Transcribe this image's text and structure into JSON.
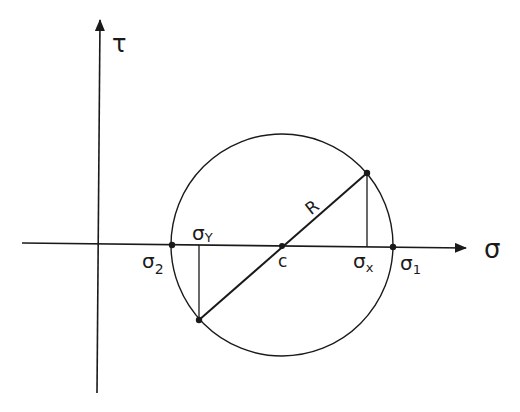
{
  "diagram": {
    "type": "mohr-circle",
    "axes": {
      "horizontal_label": "σ",
      "vertical_label": "τ"
    },
    "points": {
      "sigma_2": {
        "label": "σ",
        "sub": "2"
      },
      "sigma_y": {
        "label": "σ",
        "sub": "Y"
      },
      "center": {
        "label": "c"
      },
      "sigma_x": {
        "label": "σ",
        "sub": "x"
      },
      "sigma_1": {
        "label": "σ",
        "sub": "1"
      }
    },
    "radius_label": "R",
    "colors": {
      "stroke": "#1a1a1a",
      "background": "#ffffff"
    }
  }
}
